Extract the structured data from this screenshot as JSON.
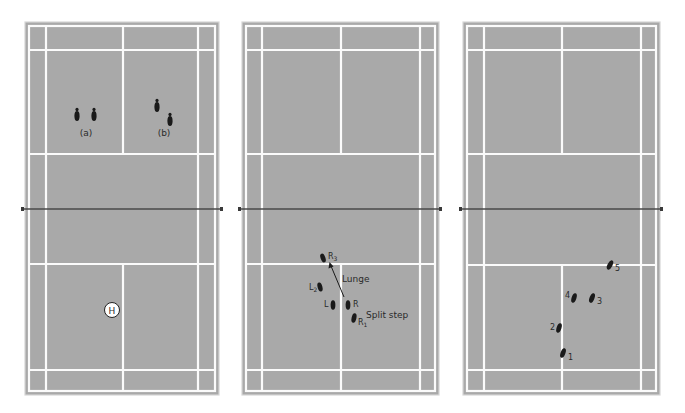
{
  "figure": {
    "panels": [
      {
        "id": "court-1",
        "labels": {
          "a": "(a)",
          "b": "(b)",
          "home": "H"
        }
      },
      {
        "id": "court-2",
        "labels": {
          "r3": "R",
          "r3_sub": "3",
          "l2": "L",
          "l2_sub": "2",
          "l": "L",
          "r": "R",
          "r1": "R",
          "r1_sub": "1",
          "lunge": "Lunge",
          "split_step": "Split step"
        }
      },
      {
        "id": "court-3",
        "labels": {
          "s1": "1",
          "s2": "2",
          "s3": "3",
          "s4": "4",
          "s5": "5"
        }
      }
    ],
    "colors": {
      "court": "#a9a9a9",
      "lines": "#fbfbfb",
      "footprint": "#1a1a1a",
      "net": "#4a4a4a"
    }
  }
}
